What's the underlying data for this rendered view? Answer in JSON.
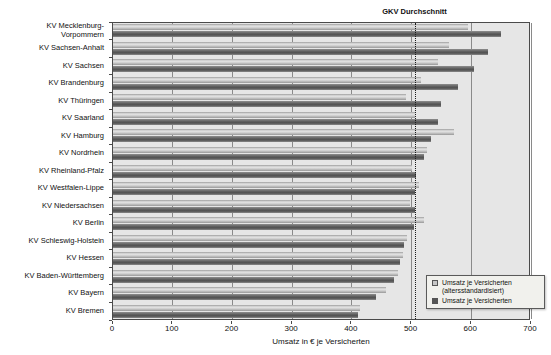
{
  "chart": {
    "xlabel": "Umsatz in € je Versicherten",
    "legend": [
      {
        "swatch": "light",
        "lines": [
          "Umsatz je Versicherten",
          "(altersstandardisiert)"
        ]
      },
      {
        "swatch": "dark",
        "lines": [
          "Umsatz je Versicherten"
        ]
      }
    ]
  },
  "chart_data": {
    "type": "bar",
    "orientation": "horizontal",
    "title": "",
    "xlabel": "Umsatz in € je Versicherten",
    "ylabel": "",
    "xlim": [
      0,
      700
    ],
    "xticks": [
      0,
      100,
      200,
      300,
      400,
      500,
      600,
      700
    ],
    "grid": true,
    "legend_position": "bottom-right",
    "reference_line": {
      "label": "GKV Durchschnitt",
      "value": 505,
      "style": "dotted"
    },
    "categories": [
      "KV Mecklenburg-\nVorpommern",
      "KV Sachsen-Anhalt",
      "KV Sachsen",
      "KV Brandenburg",
      "KV Thüringen",
      "KV Saarland",
      "KV Hamburg",
      "KV Nordrhein",
      "KV Rheinland-Pfalz",
      "KV Westfalen-Lippe",
      "KV Niedersachsen",
      "KV Berlin",
      "KV Schleswig-Holstein",
      "KV Hessen",
      "KV Baden-Württemberg",
      "KV Bayern",
      "KV Bremen"
    ],
    "series": [
      {
        "name": "Umsatz je Versicherten (altersstandardisiert)",
        "color": "#c6c6c6",
        "values": [
          595,
          562,
          545,
          516,
          490,
          506,
          571,
          526,
          501,
          513,
          498,
          521,
          492,
          485,
          477,
          457,
          414
        ]
      },
      {
        "name": "Umsatz je Versicherten",
        "color": "#565656",
        "values": [
          650,
          628,
          605,
          577,
          549,
          545,
          533,
          520,
          507,
          506,
          505,
          504,
          488,
          481,
          470,
          440,
          410
        ]
      }
    ]
  },
  "colors": {
    "plot_bg": "#e6e6e6",
    "grid": "#8a8a8a",
    "bar_light": "#c6c6c6",
    "bar_dark": "#565656",
    "reference_line": "#1a1a1a"
  }
}
